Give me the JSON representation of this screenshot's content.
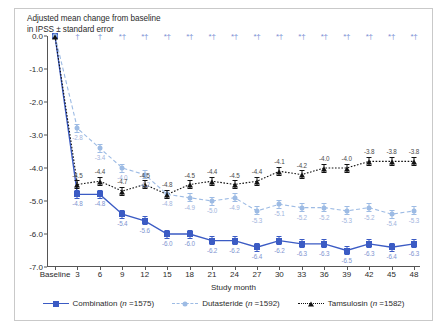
{
  "chart_data": {
    "type": "line",
    "title": "Adjusted mean change from baseline\nin IPSS ± standard error",
    "xlabel": "Study month",
    "ylabel": "",
    "ylim": [
      -7.0,
      0.0
    ],
    "ytick_labels": [
      "0.0",
      "-1.0",
      "-2.0",
      "-3.0",
      "-4.0",
      "-5.0",
      "-6.0",
      "-7.0"
    ],
    "ytick_values": [
      0.0,
      -1.0,
      -2.0,
      -3.0,
      -4.0,
      -5.0,
      -6.0,
      -7.0
    ],
    "categories": [
      "Baseline",
      "3",
      "6",
      "9",
      "12",
      "15",
      "18",
      "21",
      "24",
      "27",
      "30",
      "33",
      "36",
      "39",
      "42",
      "45",
      "48"
    ],
    "grid": false,
    "legend_position": "bottom",
    "series": [
      {
        "name": "Combination",
        "legend_label": "Combination (n =1575)",
        "n": 1575,
        "color": "#3b5bc4",
        "marker": "square",
        "linestyle": "solid",
        "values": [
          0.0,
          -4.8,
          -4.8,
          -5.4,
          -5.6,
          -6.0,
          -6.0,
          -6.2,
          -6.2,
          -6.4,
          -6.2,
          -6.3,
          -6.3,
          -6.5,
          -6.3,
          -6.4,
          -6.3
        ],
        "labels": [
          "",
          "-4.8",
          "-4.8",
          "-5.4",
          "-5.6",
          "-6.0",
          "-6.0",
          "-6.2",
          "-6.2",
          "-6.4",
          "-6.2",
          "-6.3",
          "-6.3",
          "-6.5",
          "-6.3",
          "-6.4",
          "-6.3"
        ]
      },
      {
        "name": "Dutasteride",
        "legend_label": "Dutasteride (n =1592)",
        "n": 1592,
        "color": "#9dbbe4",
        "marker": "circle",
        "linestyle": "dashed",
        "values": [
          0.0,
          -2.8,
          -3.4,
          -4.0,
          -4.2,
          -4.8,
          -4.9,
          -5.0,
          -4.9,
          -5.3,
          -5.1,
          -5.2,
          -5.2,
          -5.3,
          -5.2,
          -5.4,
          -5.3
        ],
        "labels": [
          "",
          "-2.8",
          "-3.4",
          "-4.0",
          "-4.2",
          "-4.8",
          "-4.9",
          "-5.0",
          "-4.9",
          "-5.3",
          "-5.1",
          "-5.2",
          "-5.2",
          "-5.3",
          "-5.2",
          "-5.4",
          "-5.3"
        ]
      },
      {
        "name": "Tamsulosin",
        "legend_label": "Tamsulosin (n =1582)",
        "n": 1582,
        "color": "#111111",
        "marker": "triangle",
        "linestyle": "dotted",
        "values": [
          0.0,
          -4.5,
          -4.4,
          -4.7,
          -4.5,
          -4.8,
          -4.5,
          -4.4,
          -4.5,
          -4.4,
          -4.1,
          -4.2,
          -4.0,
          -4.0,
          -3.8,
          -3.8,
          -3.8
        ],
        "labels": [
          "",
          "-4.5",
          "-4.4",
          "-4.7",
          "-4.5",
          "-4.8",
          "-4.5",
          "-4.4",
          "-4.5",
          "-4.4",
          "-4.1",
          "-4.2",
          "-4.0",
          "-4.0",
          "-3.8",
          "-3.8",
          "-3.8"
        ]
      }
    ],
    "significance_markers": [
      "",
      "†",
      "†",
      "*†",
      "*†",
      "*†",
      "*†",
      "*†",
      "*†",
      "*†",
      "*†",
      "*†",
      "*†",
      "*†",
      "*†",
      "*†",
      "*†"
    ]
  }
}
